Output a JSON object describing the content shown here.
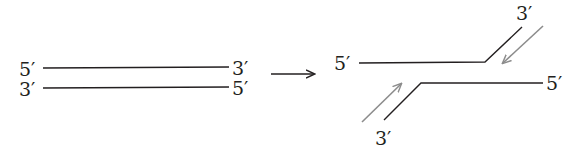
{
  "diagram": {
    "type": "dna-strand-separation",
    "left": {
      "top_strand": {
        "left_label": "5′",
        "right_label": "3′"
      },
      "bottom_strand": {
        "left_label": "3′",
        "right_label": "5′"
      }
    },
    "transition_arrow": "right-arrow",
    "right": {
      "upper_strand": {
        "left_label": "5′",
        "end_label": "3′"
      },
      "lower_strand": {
        "end_label": "3′",
        "right_label": "5′"
      },
      "synthesis_arrows": [
        {
          "position": "upper-right",
          "direction": "down-left",
          "color": "#8c8c8c"
        },
        {
          "position": "lower-left",
          "direction": "up-right",
          "color": "#8c8c8c"
        }
      ]
    },
    "colors": {
      "strand": "#231f20",
      "synthesis_arrow": "#8c8c8c",
      "background": "#ffffff"
    }
  }
}
